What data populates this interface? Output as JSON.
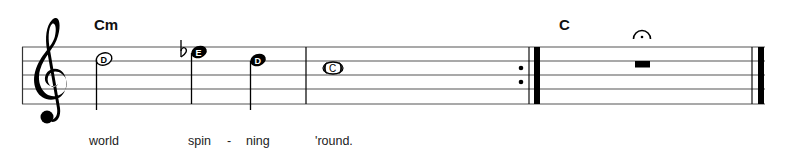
{
  "score": {
    "clef": "treble",
    "staff": {
      "left_x": 22,
      "right_x": 765,
      "line_ys": [
        47,
        61,
        75,
        89,
        104
      ],
      "line_color": "#555555"
    },
    "chords": [
      {
        "label": "Cm",
        "x": 94,
        "y": 30
      },
      {
        "label": "C",
        "x": 559,
        "y": 30
      }
    ],
    "measures": [
      {
        "index": 1,
        "notes": [
          {
            "letter": "D",
            "pitch": "D5",
            "duration": "half",
            "x": 104,
            "y": 60
          },
          {
            "letter": "E",
            "pitch": "Eb5",
            "duration": "quarter",
            "accidental": "flat",
            "x": 199,
            "y": 52
          },
          {
            "letter": "D",
            "pitch": "D5",
            "duration": "quarter",
            "x": 258,
            "y": 60
          }
        ]
      },
      {
        "index": 2,
        "notes": [
          {
            "letter": "C",
            "pitch": "C5",
            "duration": "whole",
            "x": 333,
            "y": 68
          }
        ],
        "ending_barline": "repeat-end"
      },
      {
        "index": 3,
        "rest": {
          "duration": "whole",
          "x": 642,
          "fermata": true
        },
        "ending_barline": "final"
      }
    ],
    "barlines": {
      "measure1_end_x": 306,
      "repeat_thin_x": 529,
      "repeat_thick_x": 534,
      "final_thin_x": 752,
      "final_thick_x": 758
    },
    "lyrics": [
      {
        "text": "world",
        "x": 89
      },
      {
        "text": "spin",
        "x": 188
      },
      {
        "text": "-",
        "x": 227
      },
      {
        "text": "ning",
        "x": 246
      },
      {
        "text": "'round.",
        "x": 315
      }
    ],
    "lyrics_baseline_y": 145
  }
}
